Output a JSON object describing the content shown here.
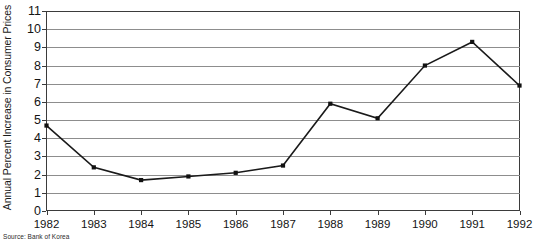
{
  "chart_data": {
    "type": "line",
    "title": "",
    "subtitle": "",
    "xlabel": "",
    "ylabel": "Annual Percent Increase in Consumer Prices",
    "categories": [
      "1982",
      "1983",
      "1984",
      "1985",
      "1986",
      "1987",
      "1988",
      "1989",
      "1990",
      "1991",
      "1992"
    ],
    "x": [
      1982,
      1983,
      1984,
      1985,
      1986,
      1987,
      1988,
      1989,
      1990,
      1991,
      1992
    ],
    "values": [
      4.7,
      2.4,
      1.7,
      1.9,
      2.1,
      2.5,
      5.9,
      5.1,
      8.0,
      9.3,
      6.9
    ],
    "series": [
      {
        "name": "Annual Percent Increase in Consumer Prices",
        "values": [
          4.7,
          2.4,
          1.7,
          1.9,
          2.1,
          2.5,
          5.9,
          5.1,
          8.0,
          9.3,
          6.9
        ]
      }
    ],
    "ylim": [
      0,
      11
    ],
    "yticks": [
      0,
      1,
      2,
      3,
      4,
      5,
      6,
      7,
      8,
      9,
      10,
      11
    ],
    "ytick_labels": [
      "0",
      "1",
      "2",
      "3",
      "4",
      "5",
      "6",
      "7",
      "8",
      "9",
      "10",
      "11"
    ],
    "xlim": [
      1982,
      1992
    ],
    "grid": "horizontal",
    "legend": "none",
    "line_color": "#1a1a1a",
    "marker": "square",
    "marker_color": "#111111",
    "gridline_color": "#8d8d8d",
    "frame_color": "#3b3b3b",
    "annotations": []
  },
  "source": {
    "text": "Source: Bank of Korea"
  }
}
